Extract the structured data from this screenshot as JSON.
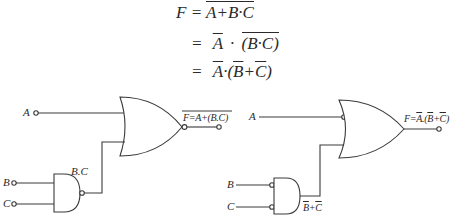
{
  "equations": {
    "line1": {
      "lhs": "F",
      "eq": "=",
      "rhs": "A+B·C"
    },
    "line2": {
      "eq": "=",
      "a": "A",
      "dot": "·",
      "rhs": "(B·C)"
    },
    "line3": {
      "eq": "=",
      "a": "A",
      "dot": "·",
      "open": "(",
      "b": "B",
      "plus": "+",
      "c": "C",
      "close": ")"
    }
  },
  "left_circuit": {
    "input_a": "A",
    "input_b": "B",
    "input_c": "C",
    "nand_output_label": "B.C",
    "output_label_prefix": "F=",
    "output_label_expr": "A+(B.C)",
    "gates": [
      "NAND",
      "NOR"
    ]
  },
  "right_circuit": {
    "input_a": "A",
    "input_b": "B",
    "input_c": "C",
    "and_output_label": {
      "b": "B",
      "plus": "+",
      "c": "C"
    },
    "output_label": {
      "prefix": "F=",
      "a": "A",
      "dot": ".(",
      "b": "B",
      "plus": "+",
      "c": "C",
      "close": ")"
    },
    "gates": [
      "AND with inverted inputs",
      "OR with inverted A input"
    ]
  },
  "colors": {
    "line": "#3a3a3a",
    "background": "#ffffff"
  }
}
